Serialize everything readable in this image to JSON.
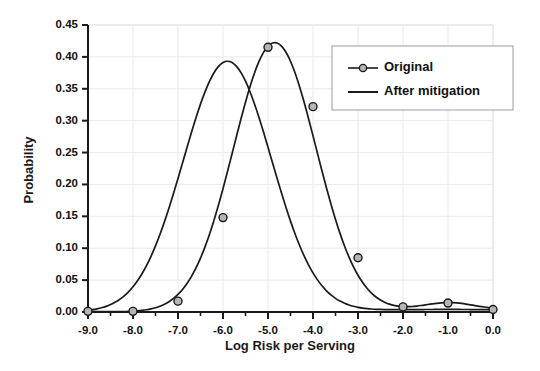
{
  "chart_data": {
    "type": "line",
    "title": "",
    "xlabel": "Log Risk per Serving",
    "ylabel": "Probability",
    "xlim": [
      -9.0,
      0.0
    ],
    "ylim": [
      0.0,
      0.45
    ],
    "xticks": [
      -9.0,
      -8.0,
      -7.0,
      -6.0,
      -5.0,
      -4.0,
      -3.0,
      -2.0,
      -1.0,
      0.0
    ],
    "xtick_labels": [
      "-9.0",
      "-8.0",
      "-7.0",
      "-6.0",
      "-5.0",
      "-4.0",
      "-3.0",
      "-2.0",
      "-1.0",
      "0.0"
    ],
    "yticks": [
      0.0,
      0.05,
      0.1,
      0.15,
      0.2,
      0.25,
      0.3,
      0.35,
      0.4,
      0.45
    ],
    "ytick_labels": [
      "0.00",
      "0.05",
      "0.10",
      "0.15",
      "0.20",
      "0.25",
      "0.30",
      "0.35",
      "0.40",
      "0.45"
    ],
    "grid": true,
    "legend_position": "upper right",
    "series": [
      {
        "name": "Original",
        "marker": "circle",
        "color": "#1a1a1a",
        "marker_fill": "#b5b5b5",
        "x": [
          -9.0,
          -8.0,
          -7.0,
          -6.0,
          -5.0,
          -4.0,
          -3.0,
          -2.0,
          -1.0,
          0.0
        ],
        "values": [
          0.001,
          0.001,
          0.017,
          0.148,
          0.415,
          0.322,
          0.085,
          0.008,
          0.014,
          0.004
        ],
        "peak_x": -4.85,
        "peak_y": 0.422
      },
      {
        "name": "After mitigation",
        "marker": "none",
        "color": "#1a1a1a",
        "x": [
          -9.0,
          -8.5,
          -8.0,
          -7.5,
          -7.0,
          -6.5,
          -6.0,
          -5.9,
          -5.5,
          -5.0,
          -4.5,
          -4.0,
          -3.5,
          -3.0,
          -2.5,
          -2.0,
          -1.5,
          -1.0,
          -0.5,
          0.0
        ],
        "values": [
          0.001,
          0.002,
          0.004,
          0.012,
          0.035,
          0.105,
          0.265,
          0.393,
          0.372,
          0.255,
          0.135,
          0.06,
          0.025,
          0.01,
          0.006,
          0.005,
          0.004,
          0.004,
          0.003,
          0.003
        ],
        "peak_x": -5.9,
        "peak_y": 0.393
      }
    ]
  },
  "legend": {
    "entries": [
      {
        "label": "Original"
      },
      {
        "label": "After mitigation"
      }
    ]
  },
  "colors": {
    "axis": "#1a1a1a",
    "grid": "#e9e9ef",
    "curve": "#1a1a1a",
    "marker_fill": "#b5b5b5",
    "legend_border": "#9a9aa5",
    "background": "#ffffff"
  }
}
